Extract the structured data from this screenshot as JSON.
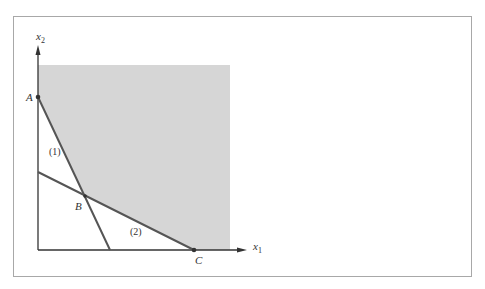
{
  "diagram": {
    "type": "linear-programming-feasible-region",
    "axes": {
      "x_label": "x",
      "x_sub": "1",
      "y_label": "x",
      "y_sub": "2"
    },
    "points": [
      {
        "name": "A",
        "label": "A"
      },
      {
        "name": "B",
        "label": "B"
      },
      {
        "name": "C",
        "label": "C"
      }
    ],
    "constraints": [
      {
        "label": "(1)"
      },
      {
        "label": "(2)"
      }
    ],
    "colors": {
      "feasible_region": "#d6d6d6",
      "lines": "#555555",
      "axes": "#333333",
      "frame": "#a8a8a8"
    }
  }
}
